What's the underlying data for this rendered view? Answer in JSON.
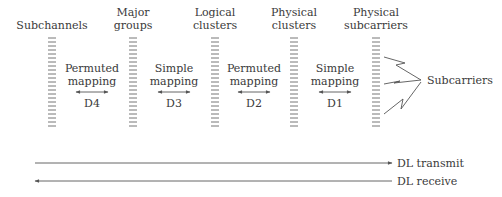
{
  "columns": [
    {
      "id": "subchannels",
      "label_lines": [
        "",
        "Subchannels"
      ],
      "x": 52
    },
    {
      "id": "major-groups",
      "label_lines": [
        "Major",
        "groups"
      ],
      "x": 133
    },
    {
      "id": "logical-clusters",
      "label_lines": [
        "Logical",
        "clusters"
      ],
      "x": 215
    },
    {
      "id": "physical-clusters",
      "label_lines": [
        "Physical",
        "clusters"
      ],
      "x": 294
    },
    {
      "id": "physical-subcarriers",
      "label_lines": [
        "Physical",
        "subcarriers"
      ],
      "x": 376
    }
  ],
  "mappings": [
    {
      "id": "d4",
      "line1": "Permuted",
      "line2": "mapping",
      "code": "D4",
      "x": 92
    },
    {
      "id": "d3",
      "line1": "Simple",
      "line2": "mapping",
      "code": "D3",
      "x": 174
    },
    {
      "id": "d2",
      "line1": "Permuted",
      "line2": "mapping",
      "code": "D2",
      "x": 254
    },
    {
      "id": "d1",
      "line1": "Simple",
      "line2": "mapping",
      "code": "D1",
      "x": 335
    }
  ],
  "subcarriers_label": "Subcarriers",
  "flows": {
    "transmit": "DL transmit",
    "receive": "DL receive"
  },
  "colors": {
    "line": "#555555",
    "text": "#3a3a3a",
    "dash": "#777777"
  }
}
